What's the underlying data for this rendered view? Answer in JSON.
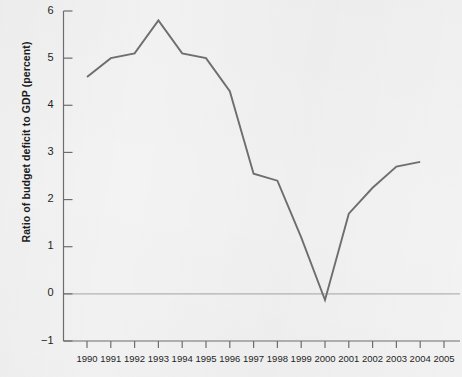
{
  "chart_data": {
    "type": "line",
    "title": "",
    "xlabel": "",
    "ylabel": "Ratio of budget deficit to GDP (percent)",
    "x": [
      1990,
      1991,
      1992,
      1993,
      1994,
      1995,
      1996,
      1997,
      1998,
      1999,
      2000,
      2001,
      2002,
      2003,
      2004
    ],
    "values": [
      4.6,
      5.0,
      5.1,
      5.8,
      5.1,
      5.0,
      4.3,
      2.55,
      2.4,
      1.2,
      -0.13,
      1.7,
      2.25,
      2.7,
      2.8
    ],
    "xlim": [
      1989.0,
      2005.8
    ],
    "ylim": [
      -1,
      6
    ],
    "yticks": [
      -1,
      0,
      1,
      2,
      3,
      4,
      5,
      6
    ],
    "ytick_labels": [
      "−1",
      "0",
      "1",
      "2",
      "3",
      "4",
      "5",
      "6"
    ],
    "xticks": [
      1990,
      1991,
      1992,
      1993,
      1994,
      1995,
      1996,
      1997,
      1998,
      1999,
      2000,
      2001,
      2002,
      2003,
      2004,
      2005
    ],
    "xtick_labels": [
      "1990",
      "1991",
      "1992",
      "1993",
      "1994",
      "1995",
      "1996",
      "1997",
      "1998",
      "1999",
      "2000",
      "2001",
      "2002",
      "2003",
      "2004",
      "2005"
    ],
    "grid": false,
    "zero_line": true,
    "legend": null,
    "legend_position": "none",
    "series": [
      {
        "name": "Ratio of budget deficit to GDP",
        "values": [
          4.6,
          5.0,
          5.1,
          5.8,
          5.1,
          5.0,
          4.3,
          2.55,
          2.4,
          1.2,
          -0.13,
          1.7,
          2.25,
          2.7,
          2.8
        ]
      }
    ],
    "colors": {
      "line": "#6f6f6f",
      "axis": "#6e6e6e",
      "zero_line": "#b4b4b4",
      "background": "#f3f3f3",
      "text": "#1f1f1f"
    }
  }
}
